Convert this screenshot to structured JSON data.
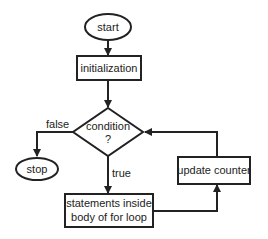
{
  "diagram": {
    "type": "flowchart",
    "nodes": {
      "start": {
        "label": "start",
        "shape": "ellipse"
      },
      "init": {
        "label": "initialization",
        "shape": "rectangle"
      },
      "condition": {
        "line1": "condition",
        "line2": "?",
        "shape": "diamond"
      },
      "stop": {
        "label": "stop",
        "shape": "ellipse"
      },
      "body": {
        "line1": "statements inside",
        "line2": "body of for loop",
        "shape": "rectangle"
      },
      "update": {
        "label": "update counter",
        "shape": "rectangle"
      }
    },
    "edges": [
      {
        "from": "start",
        "to": "init",
        "label": ""
      },
      {
        "from": "init",
        "to": "condition",
        "label": ""
      },
      {
        "from": "condition",
        "to": "stop",
        "label": "false"
      },
      {
        "from": "condition",
        "to": "body",
        "label": "true"
      },
      {
        "from": "body",
        "to": "update",
        "label": ""
      },
      {
        "from": "update",
        "to": "condition",
        "label": ""
      }
    ],
    "edge_labels": {
      "false": "false",
      "true": "true"
    },
    "colors": {
      "stroke": "#222222",
      "background": "#ffffff",
      "text": "#222222"
    }
  }
}
